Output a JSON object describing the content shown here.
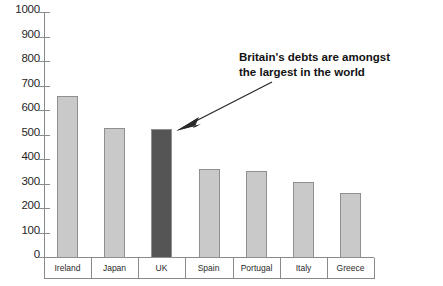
{
  "chart_data": {
    "type": "bar",
    "title": "",
    "subtitle": "",
    "xlabel": "",
    "ylabel": "",
    "categories": [
      "Ireland",
      "Japan",
      "UK",
      "Spain",
      "Portugal",
      "Italy",
      "Greece"
    ],
    "values": [
      660,
      530,
      525,
      365,
      355,
      310,
      265
    ],
    "ylim": [
      0,
      1000
    ],
    "y_ticks": [
      0,
      100,
      200,
      300,
      400,
      500,
      600,
      700,
      800,
      900,
      1000
    ],
    "y_tick_labels": [
      "0",
      "100",
      "200",
      "300",
      "400",
      "500",
      "600",
      "700",
      "800",
      "900",
      "1000"
    ],
    "grid": false,
    "legend": "none",
    "bar_colors": [
      "#c9c9c9",
      "#c9c9c9",
      "#555555",
      "#c9c9c9",
      "#c9c9c9",
      "#c9c9c9",
      "#c9c9c9"
    ],
    "highlighted_category": "UK",
    "annotations": [
      {
        "text_line_1": "Britain's debts are amongst",
        "text_line_2": "the largest in the world",
        "points_to": "UK"
      }
    ]
  },
  "axes": {
    "y": {
      "ticks": [
        {
          "label": "1000",
          "value": 1000
        },
        {
          "label": "900",
          "value": 900
        },
        {
          "label": "800",
          "value": 800
        },
        {
          "label": "700",
          "value": 700
        },
        {
          "label": "600",
          "value": 600
        },
        {
          "label": "500",
          "value": 500
        },
        {
          "label": "400",
          "value": 400
        },
        {
          "label": "300",
          "value": 300
        },
        {
          "label": "200",
          "value": 200
        },
        {
          "label": "100",
          "value": 100
        },
        {
          "label": "0",
          "value": 0
        }
      ]
    },
    "x": {
      "labels": [
        "Ireland",
        "Japan",
        "UK",
        "Spain",
        "Portugal",
        "Italy",
        "Greece"
      ]
    }
  },
  "annotation": {
    "line1": "Britain's debts are amongst",
    "line2": "the largest in the world"
  },
  "colors": {
    "bar_default": "#c9c9c9",
    "bar_highlight": "#555555",
    "bar_border": "#8f8f8f",
    "axis": "#8a8a8a",
    "text": "#1a1a1a"
  }
}
